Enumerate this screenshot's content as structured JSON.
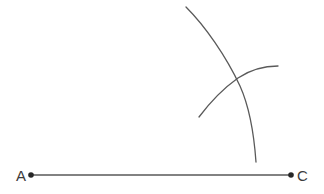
{
  "figure": {
    "background_color": "#ffffff",
    "stroke_color": "#5a5a5a",
    "label_color": "#3c3c3c",
    "dot_color": "#262626",
    "stroke_width": 1.3,
    "width": 324,
    "height": 194
  },
  "segment": {
    "name": "AC",
    "x1": 31,
    "y1": 175,
    "x2": 291,
    "y2": 175,
    "path": "M 31 175 L 291 175",
    "length_px": 260
  },
  "points": [
    {
      "id": "A",
      "label": "A",
      "cx": 31,
      "cy": 175,
      "r": 2.8,
      "label_x": 26,
      "label_y": 181,
      "label_side": "left"
    },
    {
      "id": "C",
      "label": "C",
      "cx": 291,
      "cy": 175,
      "r": 2.8,
      "label_x": 297,
      "label_y": 181,
      "label_side": "right"
    }
  ],
  "arcs": [
    {
      "id": "arc-long",
      "name": "long-arc",
      "start_x": 186,
      "start_y": 7,
      "end_x": 256,
      "end_y": 162,
      "path": "M 186 7 C 205 26 226 56 240 86 C 249 106 254 134 256 162",
      "stroke_width": 1.3
    },
    {
      "id": "arc-short",
      "name": "short-arc",
      "start_x": 199,
      "start_y": 117,
      "end_x": 278,
      "end_y": 66,
      "path": "M 199 117 C 211 101 224 88 238 78 C 250 70 265 66 278 66",
      "stroke_width": 1.3
    }
  ],
  "intersection": {
    "label": "",
    "x": 237,
    "y": 78,
    "visible": false
  }
}
